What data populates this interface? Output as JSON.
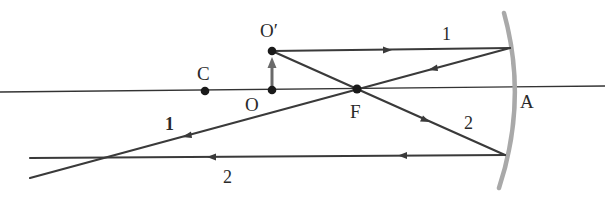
{
  "diagram": {
    "type": "concave-mirror-ray-diagram",
    "colors": {
      "ray": "#3a3a3a",
      "axis": "#333333",
      "mirror": "#a9a9a9",
      "point": "#1a1a1a",
      "object_arrow": "#6a6a6a",
      "background": "#ffffff"
    },
    "points": {
      "C": {
        "label": "C"
      },
      "O": {
        "label": "O"
      },
      "O_prime": {
        "label": "O′"
      },
      "F": {
        "label": "F"
      },
      "A": {
        "label": "A"
      }
    },
    "rays": [
      {
        "id": "1",
        "label_incident": "1",
        "label_reflected": "1",
        "description": "parallel to axis, reflects through F"
      },
      {
        "id": "2",
        "label_incident": "2",
        "label_reflected": "2",
        "description": "through F, reflects parallel to axis"
      }
    ]
  }
}
